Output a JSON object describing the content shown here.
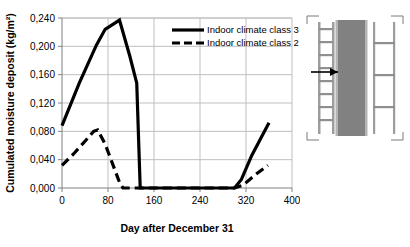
{
  "chart_data": {
    "type": "line",
    "title": "",
    "xlabel": "Day after December 31",
    "ylabel": "Cumulated moisture deposit (kg/m²)",
    "xlim": [
      0,
      400
    ],
    "ylim": [
      0.0,
      0.24
    ],
    "xticks": [
      "0",
      "80",
      "160",
      "240",
      "320",
      "400"
    ],
    "xtick_values": [
      0,
      80,
      160,
      240,
      320,
      400
    ],
    "yticks": [
      "0,000",
      "0,040",
      "0,080",
      "0,120",
      "0,160",
      "0,200",
      "0,240"
    ],
    "ytick_values": [
      0.0,
      0.04,
      0.08,
      0.12,
      0.16,
      0.2,
      0.24
    ],
    "grid": true,
    "grid_color": "#bfbfbf",
    "legend_position": "top-right",
    "series": [
      {
        "name": "Indoor climate class 3",
        "style": "solid",
        "color": "#000000",
        "width": 3.2,
        "x": [
          0,
          30,
          60,
          75,
          100,
          118,
          130,
          136,
          160,
          240,
          300,
          312,
          330,
          360
        ],
        "y": [
          0.088,
          0.148,
          0.202,
          0.224,
          0.237,
          0.186,
          0.148,
          0.0,
          0.0,
          0.0,
          0.0,
          0.012,
          0.046,
          0.092
        ]
      },
      {
        "name": "Indoor climate class 2",
        "style": "dashed",
        "color": "#000000",
        "width": 3.2,
        "x": [
          0,
          20,
          40,
          55,
          62,
          75,
          88,
          100,
          106,
          160,
          240,
          300,
          315,
          335,
          358
        ],
        "y": [
          0.032,
          0.048,
          0.066,
          0.08,
          0.082,
          0.062,
          0.034,
          0.008,
          0.0,
          0.0,
          0.0,
          0.0,
          0.004,
          0.018,
          0.032
        ]
      }
    ]
  },
  "legend": {
    "entries": [
      {
        "label": "Indoor climate class 3",
        "style": "solid"
      },
      {
        "label": "Indoor climate class 2",
        "style": "dashed"
      }
    ]
  },
  "wall_diagram": {
    "name": "wall-cross-section",
    "core_color": "#808080",
    "layer_color": "#a6a6a6",
    "line_color": "#4d4d4d",
    "arrow_label": ""
  }
}
